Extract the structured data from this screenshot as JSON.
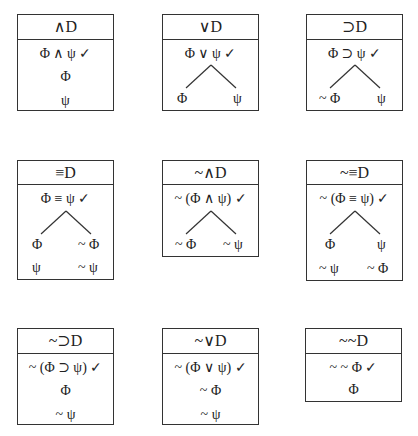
{
  "rules": [
    {
      "name": "and-decomposition",
      "title": "∧D",
      "premise": "Φ ∧ ψ ✓",
      "lines": [
        "Φ",
        "ψ"
      ]
    },
    {
      "name": "or-decomposition",
      "title": "∨D",
      "premise": "Φ ∨ ψ ✓",
      "left": [
        "Φ"
      ],
      "right": [
        "ψ"
      ]
    },
    {
      "name": "conditional-decomposition",
      "title": "⊃D",
      "premise": "Φ ⊃ ψ ✓",
      "left": [
        "~ Φ"
      ],
      "right": [
        "ψ"
      ]
    },
    {
      "name": "biconditional-decomposition",
      "title": "≡D",
      "premise": "Φ ≡ ψ ✓",
      "left": [
        "Φ",
        "ψ"
      ],
      "right": [
        "~ Φ",
        "~ ψ"
      ]
    },
    {
      "name": "negated-and-decomposition",
      "title": "~∧D",
      "premise": "~ (Φ ∧ ψ) ✓",
      "left": [
        "~ Φ"
      ],
      "right": [
        "~ ψ"
      ]
    },
    {
      "name": "negated-biconditional-decomposition",
      "title": "~≡D",
      "premise": "~ (Φ ≡ ψ) ✓",
      "left": [
        "Φ",
        "~ ψ"
      ],
      "right": [
        "ψ",
        "~ Φ"
      ]
    },
    {
      "name": "negated-conditional-decomposition",
      "title": "~⊃D",
      "premise": "~ (Φ ⊃ ψ) ✓",
      "lines": [
        "Φ",
        "~ ψ"
      ]
    },
    {
      "name": "negated-or-decomposition",
      "title": "~∨D",
      "premise": "~ (Φ ∨ ψ) ✓",
      "lines": [
        "~ Φ",
        "~ ψ"
      ]
    },
    {
      "name": "double-negation-decomposition",
      "title": "~~D",
      "premise": "~ ~ Φ ✓",
      "lines": [
        "Φ"
      ]
    }
  ]
}
